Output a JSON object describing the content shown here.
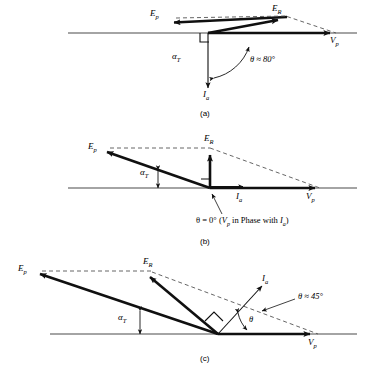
{
  "figure": {
    "type": "phasor-vector-diagram",
    "background": "#ffffff",
    "line_color": "#1a1a1a",
    "dashed_color": "#555555"
  },
  "panels": [
    {
      "id": "a",
      "caption": "(a)",
      "axis_label": "V",
      "axis_label_sub": "p",
      "vectors": [
        {
          "name": "E_p",
          "label": "E",
          "sub": "p",
          "style": "solid-bold"
        },
        {
          "name": "E_R",
          "label": "E",
          "sub": "R",
          "style": "solid-bold"
        },
        {
          "name": "I_a",
          "label": "I",
          "sub": "a",
          "style": "solid-thin"
        },
        {
          "name": "V_p",
          "label": "V",
          "sub": "p",
          "style": "solid-bold"
        }
      ],
      "angles": [
        {
          "name": "alpha_T",
          "label": "α",
          "sub": "T"
        },
        {
          "name": "theta",
          "text": "θ ≈ 80°"
        }
      ]
    },
    {
      "id": "b",
      "caption": "(b)",
      "axis_label": "V",
      "axis_label_sub": "p",
      "vectors": [
        {
          "name": "E_p",
          "label": "E",
          "sub": "p",
          "style": "solid-bold"
        },
        {
          "name": "E_R",
          "label": "E",
          "sub": "R",
          "style": "solid-bold"
        },
        {
          "name": "I_a",
          "label": "I",
          "sub": "a",
          "style": "solid-thin"
        },
        {
          "name": "V_p",
          "label": "V",
          "sub": "p",
          "style": "solid-bold"
        }
      ],
      "angles": [
        {
          "name": "alpha_T",
          "label": "α",
          "sub": "T"
        },
        {
          "name": "theta",
          "text": "θ = 0°  (V<sub>p</sub> in Phase with I<sub>a</sub>)"
        }
      ],
      "note_plain": "θ = 0° (Vp in Phase with Ia)"
    },
    {
      "id": "c",
      "caption": "(c)",
      "axis_label": "V",
      "axis_label_sub": "p",
      "vectors": [
        {
          "name": "E_p",
          "label": "E",
          "sub": "p",
          "style": "solid-bold"
        },
        {
          "name": "E_R",
          "label": "E",
          "sub": "R",
          "style": "solid-bold"
        },
        {
          "name": "I_a",
          "label": "I",
          "sub": "a",
          "style": "solid-thin"
        },
        {
          "name": "V_p",
          "label": "V",
          "sub": "p",
          "style": "solid-bold"
        }
      ],
      "angles": [
        {
          "name": "alpha_T",
          "label": "α",
          "sub": "T"
        },
        {
          "name": "theta_arc",
          "text": "θ"
        },
        {
          "name": "theta_value",
          "text": "θ ≈ 45°"
        }
      ]
    }
  ],
  "labels": {
    "a_Ep": "E",
    "a_Ep_sub": "p",
    "a_ER": "E",
    "a_ER_sub": "R",
    "a_Vp": "V",
    "a_Vp_sub": "p",
    "a_Ia": "I",
    "a_Ia_sub": "a",
    "a_alphaT": "α",
    "a_alphaT_sub": "T",
    "a_theta": "θ ≈ 80°",
    "a_caption": "(a)",
    "b_Ep": "E",
    "b_Ep_sub": "p",
    "b_ER": "E",
    "b_ER_sub": "R",
    "b_Vp": "V",
    "b_Vp_sub": "p",
    "b_Ia": "I",
    "b_Ia_sub": "a",
    "b_alphaT": "α",
    "b_alphaT_sub": "T",
    "b_theta_pre": "θ = 0°  (",
    "b_theta_V": "V",
    "b_theta_V_sub": "p",
    "b_theta_mid": " in Phase with ",
    "b_theta_I": "I",
    "b_theta_I_sub": "a",
    "b_theta_post": ")",
    "b_caption": "(b)",
    "c_Ep": "E",
    "c_Ep_sub": "p",
    "c_ER": "E",
    "c_ER_sub": "R",
    "c_Vp": "V",
    "c_Vp_sub": "p",
    "c_Ia": "I",
    "c_Ia_sub": "a",
    "c_alphaT": "α",
    "c_alphaT_sub": "T",
    "c_theta_small": "θ",
    "c_theta": "θ ≈ 45°",
    "c_caption": "(c)"
  }
}
